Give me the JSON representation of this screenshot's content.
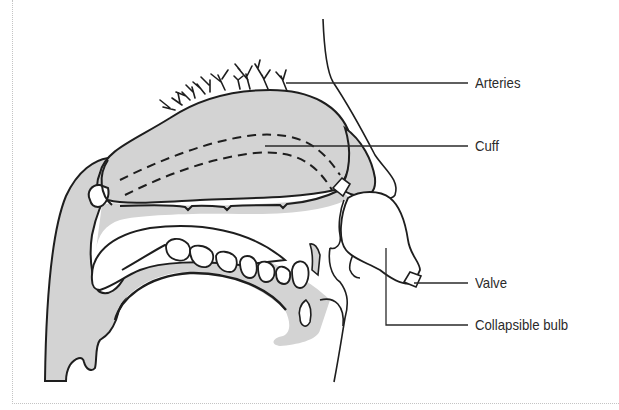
{
  "diagram": {
    "type": "anatomical-illustration",
    "colors": {
      "tissue_fill": "#d3d3d3",
      "outline": "#1e1e1e",
      "background": "#ffffff",
      "label_text": "#2a2a2a",
      "frame_border": "#c4c4c4"
    },
    "labels": [
      {
        "id": "arteries",
        "text": "Arteries",
        "x": 486,
        "y": 83
      },
      {
        "id": "cuff",
        "text": "Cuff",
        "x": 486,
        "y": 146
      },
      {
        "id": "valve",
        "text": "Valve",
        "x": 474,
        "y": 284
      },
      {
        "id": "collapsible-bulb",
        "text": "Collapsible bulb",
        "x": 474,
        "y": 325
      }
    ]
  }
}
